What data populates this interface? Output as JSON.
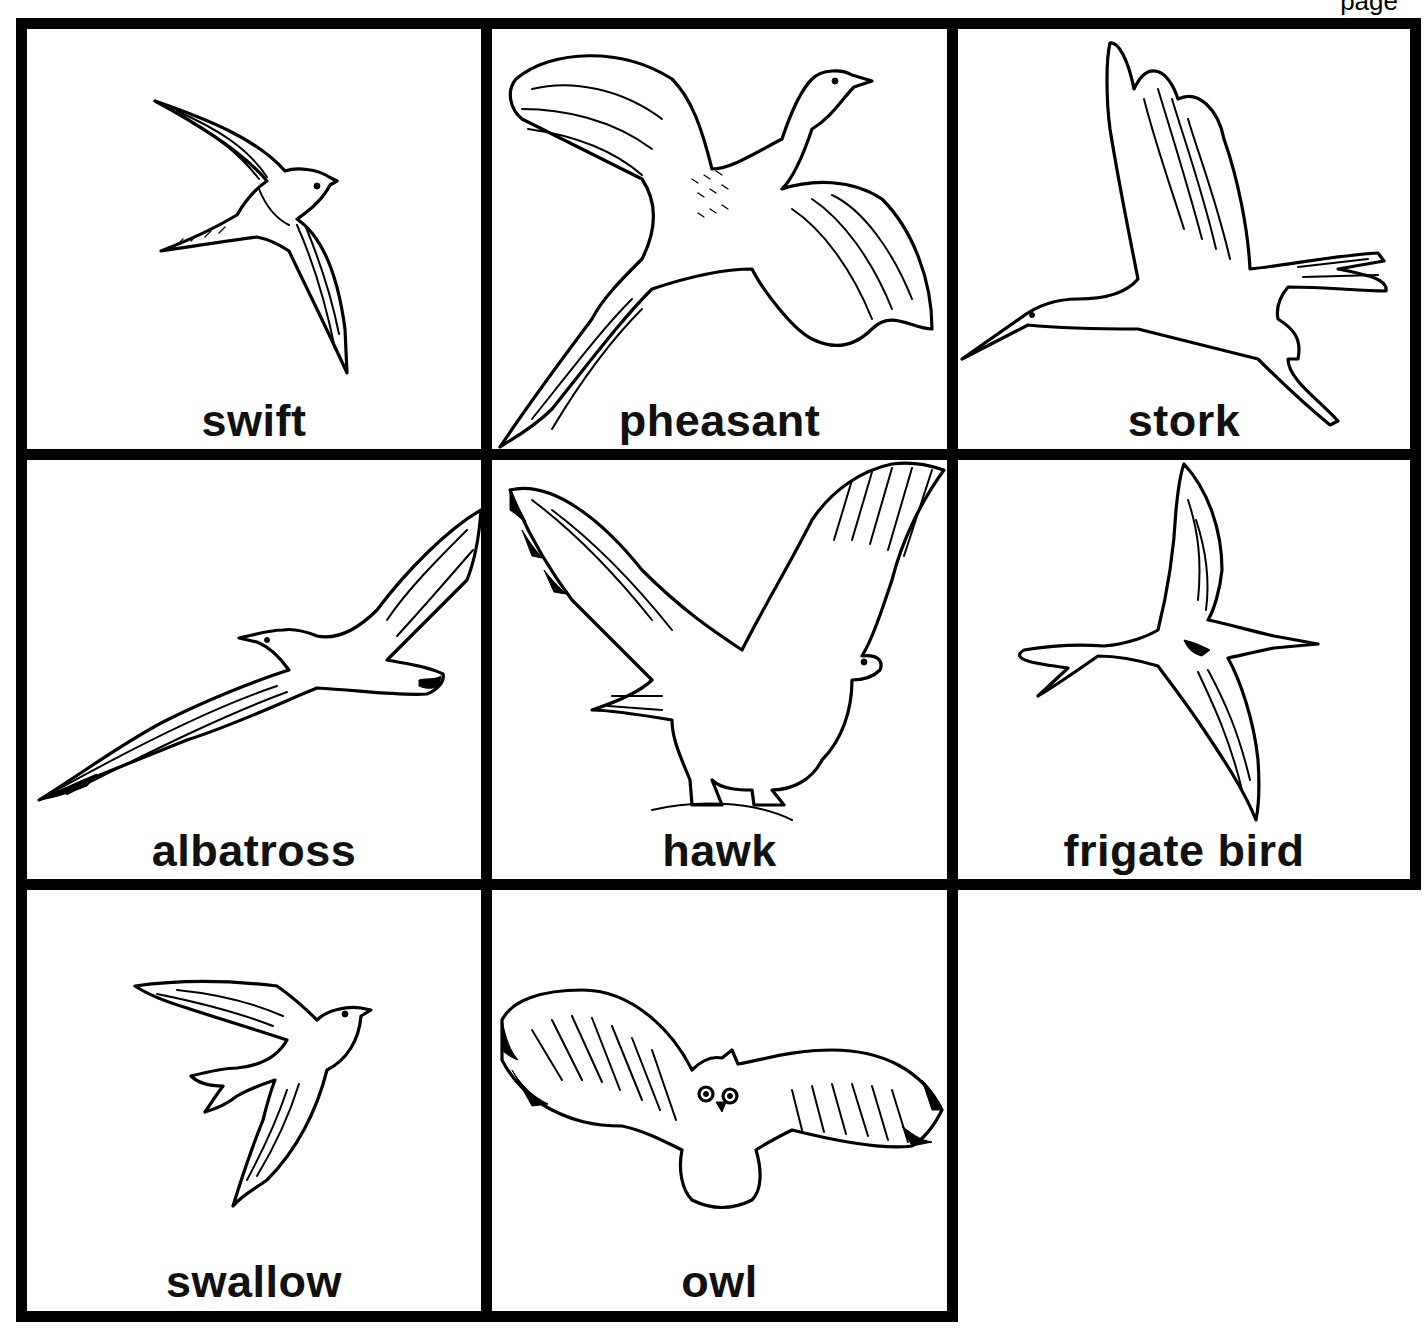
{
  "page": {
    "page_label": "page",
    "border_color": "#000000",
    "background": "#ffffff"
  },
  "cards": [
    {
      "label": "swift",
      "illustration": "swift-illustration",
      "row": 1,
      "col": 1
    },
    {
      "label": "pheasant",
      "illustration": "pheasant-illustration",
      "row": 1,
      "col": 2
    },
    {
      "label": "stork",
      "illustration": "stork-illustration",
      "row": 1,
      "col": 3
    },
    {
      "label": "albatross",
      "illustration": "albatross-illustration",
      "row": 2,
      "col": 1
    },
    {
      "label": "hawk",
      "illustration": "hawk-illustration",
      "row": 2,
      "col": 2
    },
    {
      "label": "frigate bird",
      "illustration": "frigate-bird-illustration",
      "row": 2,
      "col": 3
    },
    {
      "label": "swallow",
      "illustration": "swallow-illustration",
      "row": 3,
      "col": 1
    },
    {
      "label": "owl",
      "illustration": "owl-illustration",
      "row": 3,
      "col": 2
    }
  ]
}
